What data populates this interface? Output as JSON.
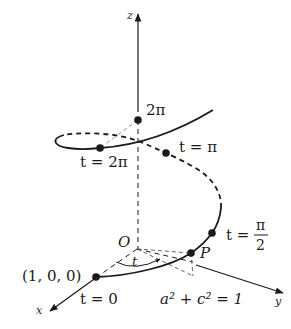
{
  "figure": {
    "axes": {
      "x_label": "x",
      "y_label": "y",
      "z_label": "z",
      "origin_label": "O"
    },
    "points": {
      "start_coord_label": "(1, 0, 0)",
      "t0_label": "t = 0",
      "t_half_pi_t": "t =",
      "t_half_pi_num": "π",
      "t_half_pi_den": "2",
      "t_pi_label": "t = π",
      "t_2pi_label": "t = 2π",
      "z_2pi_label": "2π",
      "p_label": "P"
    },
    "angle_label": "t",
    "equation_label": "a² + c² = 1",
    "colors": {
      "ink": "#1a1a1a",
      "background": "#ffffff",
      "guide": "#555555"
    }
  }
}
